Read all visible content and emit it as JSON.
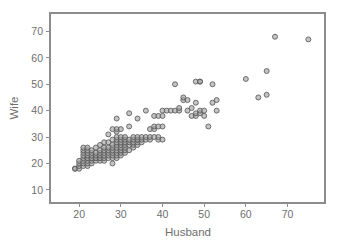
{
  "chart_data": {
    "type": "scatter",
    "title": "",
    "xlabel": "Husband",
    "ylabel": "Wife",
    "xlim": [
      13,
      79
    ],
    "ylim": [
      5,
      77
    ],
    "xticks": [
      20,
      30,
      40,
      50,
      60,
      70
    ],
    "yticks": [
      10,
      20,
      30,
      40,
      50,
      60,
      70
    ],
    "grid": false,
    "legend": null,
    "marker": {
      "shape": "circle-open",
      "fill_color": "#a0a0a0",
      "edge_color": "#585858",
      "size_px": 5
    },
    "axis_color": "#8c8c8c",
    "text_color": "#6e6e6e",
    "background_color": "#ffffff",
    "n_points": 170,
    "points": [
      [
        19,
        18
      ],
      [
        19,
        18
      ],
      [
        20,
        18
      ],
      [
        20,
        19
      ],
      [
        20,
        20
      ],
      [
        20,
        21
      ],
      [
        21,
        19
      ],
      [
        21,
        20
      ],
      [
        21,
        21
      ],
      [
        21,
        22
      ],
      [
        21,
        23
      ],
      [
        21,
        24
      ],
      [
        21,
        25
      ],
      [
        21,
        26
      ],
      [
        22,
        19
      ],
      [
        22,
        20
      ],
      [
        22,
        21
      ],
      [
        22,
        22
      ],
      [
        22,
        22
      ],
      [
        22,
        23
      ],
      [
        22,
        24
      ],
      [
        22,
        25
      ],
      [
        22,
        26
      ],
      [
        23,
        20
      ],
      [
        23,
        21
      ],
      [
        23,
        22
      ],
      [
        23,
        22
      ],
      [
        23,
        23
      ],
      [
        23,
        24
      ],
      [
        23,
        25
      ],
      [
        24,
        21
      ],
      [
        24,
        22
      ],
      [
        24,
        22
      ],
      [
        24,
        23
      ],
      [
        24,
        24
      ],
      [
        24,
        26
      ],
      [
        25,
        21
      ],
      [
        25,
        22
      ],
      [
        25,
        22
      ],
      [
        25,
        23
      ],
      [
        25,
        24
      ],
      [
        25,
        25
      ],
      [
        25,
        27
      ],
      [
        26,
        21
      ],
      [
        26,
        22
      ],
      [
        26,
        23
      ],
      [
        26,
        24
      ],
      [
        26,
        25
      ],
      [
        26,
        26
      ],
      [
        26,
        28
      ],
      [
        27,
        22
      ],
      [
        27,
        23
      ],
      [
        27,
        24
      ],
      [
        27,
        25
      ],
      [
        27,
        26
      ],
      [
        27,
        28
      ],
      [
        27,
        31
      ],
      [
        28,
        20
      ],
      [
        28,
        22
      ],
      [
        28,
        23
      ],
      [
        28,
        24
      ],
      [
        28,
        25
      ],
      [
        28,
        26
      ],
      [
        28,
        27
      ],
      [
        28,
        29
      ],
      [
        28,
        33
      ],
      [
        29,
        22
      ],
      [
        29,
        23
      ],
      [
        29,
        24
      ],
      [
        29,
        25
      ],
      [
        29,
        26
      ],
      [
        29,
        27
      ],
      [
        29,
        28
      ],
      [
        29,
        29
      ],
      [
        29,
        30
      ],
      [
        29,
        32
      ],
      [
        29,
        33
      ],
      [
        29,
        37
      ],
      [
        30,
        23
      ],
      [
        30,
        24
      ],
      [
        30,
        25
      ],
      [
        30,
        26
      ],
      [
        30,
        27
      ],
      [
        30,
        28
      ],
      [
        30,
        29
      ],
      [
        30,
        30
      ],
      [
        30,
        33
      ],
      [
        31,
        24
      ],
      [
        31,
        25
      ],
      [
        31,
        26
      ],
      [
        31,
        27
      ],
      [
        31,
        28
      ],
      [
        31,
        29
      ],
      [
        31,
        30
      ],
      [
        32,
        25
      ],
      [
        32,
        27
      ],
      [
        32,
        28
      ],
      [
        32,
        29
      ],
      [
        32,
        34
      ],
      [
        32,
        39
      ],
      [
        33,
        26
      ],
      [
        33,
        27
      ],
      [
        33,
        28
      ],
      [
        33,
        29
      ],
      [
        33,
        30
      ],
      [
        34,
        27
      ],
      [
        34,
        28
      ],
      [
        34,
        29
      ],
      [
        34,
        29
      ],
      [
        34,
        30
      ],
      [
        34,
        37
      ],
      [
        35,
        28
      ],
      [
        35,
        29
      ],
      [
        35,
        30
      ],
      [
        36,
        29
      ],
      [
        36,
        30
      ],
      [
        36,
        40
      ],
      [
        37,
        29
      ],
      [
        37,
        30
      ],
      [
        37,
        33
      ],
      [
        38,
        30
      ],
      [
        38,
        33
      ],
      [
        38,
        34
      ],
      [
        38,
        38
      ],
      [
        39,
        29
      ],
      [
        39,
        30
      ],
      [
        39,
        34
      ],
      [
        39,
        38
      ],
      [
        40,
        29
      ],
      [
        40,
        34
      ],
      [
        40,
        38
      ],
      [
        40,
        40
      ],
      [
        41,
        40
      ],
      [
        42,
        40
      ],
      [
        43,
        40
      ],
      [
        43,
        50
      ],
      [
        44,
        40
      ],
      [
        44,
        41
      ],
      [
        45,
        44
      ],
      [
        45,
        45
      ],
      [
        46,
        44
      ],
      [
        46,
        40
      ],
      [
        47,
        38
      ],
      [
        47,
        41
      ],
      [
        48,
        38
      ],
      [
        48,
        39
      ],
      [
        48,
        43
      ],
      [
        48,
        51
      ],
      [
        49,
        39
      ],
      [
        49,
        40
      ],
      [
        49,
        51
      ],
      [
        49,
        51
      ],
      [
        50,
        38
      ],
      [
        50,
        40
      ],
      [
        51,
        34
      ],
      [
        52,
        43
      ],
      [
        52,
        50
      ],
      [
        53,
        40
      ],
      [
        53,
        44
      ],
      [
        60,
        52
      ],
      [
        63,
        45
      ],
      [
        65,
        46
      ],
      [
        65,
        55
      ],
      [
        67,
        68
      ],
      [
        75,
        67
      ]
    ]
  }
}
